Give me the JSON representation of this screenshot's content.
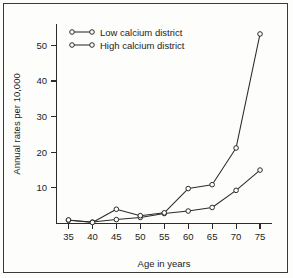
{
  "figure": {
    "border_color": "#3a3a3a",
    "background": "#fdfdfc",
    "ink_color": "#2b2b2b"
  },
  "chart_data": {
    "type": "line",
    "title": "",
    "xlabel": "Age in years",
    "ylabel": "Annual rates per 10,000",
    "x": [
      35,
      40,
      45,
      50,
      55,
      60,
      65,
      70,
      75
    ],
    "xticklabels": [
      "35",
      "40",
      "45",
      "50",
      "55",
      "60",
      "65",
      "70",
      "75"
    ],
    "yticklabels": [
      "10",
      "20",
      "30",
      "40",
      "50"
    ],
    "yticks": [
      10,
      20,
      30,
      40,
      50
    ],
    "xlim": [
      32.5,
      77.5
    ],
    "ylim": [
      0,
      56
    ],
    "grid": false,
    "legend_position": "upper left",
    "marker": "open-circle",
    "series": [
      {
        "name": "Low calcium district",
        "values": [
          0.9,
          0.4,
          1.1,
          1.7,
          2.8,
          3.5,
          4.5,
          9.3,
          15.0
        ]
      },
      {
        "name": "High calcium district",
        "values": [
          1.0,
          0.3,
          4.0,
          2.2,
          3.0,
          9.8,
          10.9,
          21.2,
          53.2
        ]
      }
    ]
  },
  "legend": {
    "entries": [
      {
        "label": "Low calcium district"
      },
      {
        "label": "High calcium district"
      }
    ]
  },
  "axes": {
    "x_title": "Age in years",
    "y_title": "Annual rates per 10,000"
  }
}
